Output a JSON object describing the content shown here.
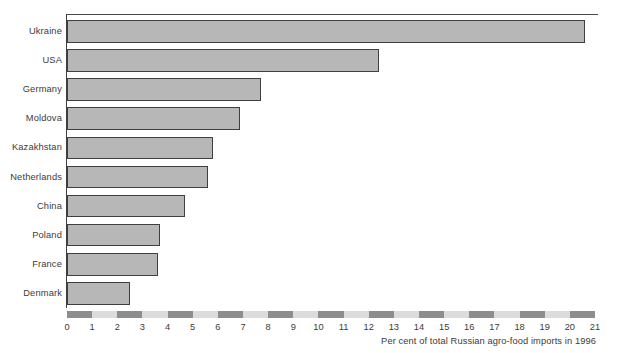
{
  "chart_data": {
    "type": "bar",
    "orientation": "horizontal",
    "title": "",
    "subtitle": "",
    "xlabel": "Per cent of total Russian agro-food imports in 1996",
    "ylabel": "",
    "xlim": [
      0,
      21
    ],
    "grid": false,
    "legend": null,
    "x_ticks": [
      0,
      1,
      2,
      3,
      4,
      5,
      6,
      7,
      8,
      9,
      10,
      11,
      12,
      13,
      14,
      15,
      16,
      17,
      18,
      19,
      20,
      21
    ],
    "categories": [
      "Ukraine",
      "USA",
      "Germany",
      "Moldova",
      "Kazakhstan",
      "Netherlands",
      "China",
      "Poland",
      "France",
      "Denmark"
    ],
    "values": [
      20.6,
      12.4,
      7.7,
      6.9,
      5.8,
      5.6,
      4.7,
      3.7,
      3.6,
      2.5
    ],
    "colors": {
      "bar_fill": "#b7b7b7",
      "bar_stroke": "#3f3f3f",
      "axis_band_light": "#dcdcdc",
      "axis_band_dark": "#8d8d8d",
      "text": "#3b3b3b",
      "background": "#ffffff"
    }
  },
  "axis_caption": "Per cent of total Russian agro-food imports in 1996"
}
